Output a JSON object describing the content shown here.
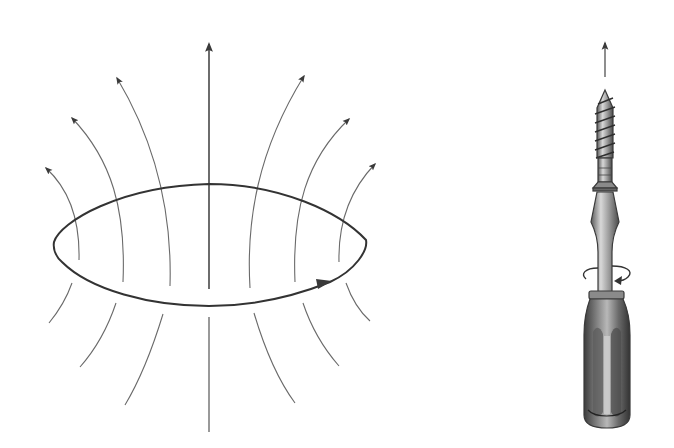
{
  "figure": {
    "type": "physics-diagram",
    "colors": {
      "background": "#ffffff",
      "line": "#333333",
      "field_line": "#6a6a6a",
      "handle_dark": "#4a4a4a",
      "handle_light": "#bdbdbd",
      "metal": "#9a9a9a"
    }
  },
  "current_loop": {
    "shape": "ellipse",
    "center": [
      210,
      245
    ],
    "left_point": [
      54,
      242
    ],
    "right_point": [
      366,
      242
    ],
    "top_y": 184,
    "bottom_y": 306,
    "current_direction_arrow": "current-arrow-icon",
    "current_arrow_position": [
      325,
      284
    ]
  },
  "field_lines": {
    "count_above": 7,
    "count_below": 7,
    "central_axis_arrow": "up-arrow-icon",
    "arrow_tips": [
      [
        44,
        166
      ],
      [
        70,
        116
      ],
      [
        115,
        75
      ],
      [
        209,
        42
      ],
      [
        306,
        73
      ],
      [
        351,
        116
      ],
      [
        377,
        161
      ]
    ]
  },
  "screwdriver": {
    "icon": "screwdriver-icon",
    "screw_icon": "screw-icon",
    "advance_arrow": "up-arrow-icon",
    "rotation_arrow": "rotation-arrow-icon",
    "center_x": 605
  }
}
